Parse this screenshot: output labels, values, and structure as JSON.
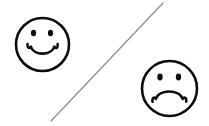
{
  "canvas": {
    "width": 209,
    "height": 126,
    "background_color": "#ffffff",
    "ink_color": "#0d0d0d",
    "divider_color": "#8a8a92",
    "title": "Smiley face and sad face separated by a diagonal line"
  },
  "happy_face": {
    "name": "Happy face",
    "expression": "smiling",
    "center_x": 42.5,
    "center_y": 44.5,
    "radius": 26.5,
    "outline_width": 2.6,
    "eyes": [
      {
        "cx": 33.5,
        "cy": 33.0,
        "rx": 2.6,
        "ry": 3.3
      },
      {
        "cx": 50.5,
        "cy": 33.0,
        "rx": 2.6,
        "ry": 3.3
      }
    ],
    "mouth_path": "M 27.5 44.0 C 27.0 48.0 29.5 49.2 30.8 46.6 C 33.5 56.0 51.5 56.0 54.4 46.6 C 55.8 49.3 58.2 48.1 57.6 44.0",
    "mouth_width": 2.6
  },
  "sad_face": {
    "name": "Sad face",
    "expression": "frowning",
    "center_x": 169.5,
    "center_y": 88.5,
    "radius": 27.5,
    "outline_width": 2.6,
    "eyes": [
      {
        "cx": 160.0,
        "cy": 77.0,
        "rx": 2.7,
        "ry": 3.4
      },
      {
        "cx": 178.5,
        "cy": 77.0,
        "rx": 2.7,
        "ry": 3.4
      }
    ],
    "mouth_path": "M 152.5 101.8 C 152.0 97.5 154.5 96.5 155.8 99.0 C 158.8 89.0 179.5 89.0 182.8 99.0 C 184.2 96.4 186.8 97.5 186.2 101.8",
    "mouth_width": 2.6
  },
  "divider": {
    "name": "Diagonal separator line",
    "x1": 163.0,
    "y1": 3.0,
    "x2": 51.0,
    "y2": 121.0,
    "width": 1.2,
    "color": "#8a8a92"
  }
}
